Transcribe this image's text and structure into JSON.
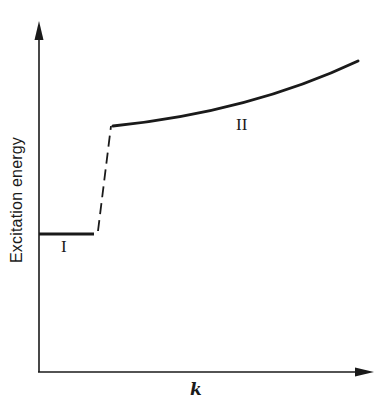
{
  "diagram": {
    "y_axis_label": "Excitation energy",
    "x_axis_label": "k",
    "regions": [
      {
        "label": "I",
        "description": "flat low-energy branch"
      },
      {
        "label": "II",
        "description": "rising high-energy branch"
      }
    ],
    "connector": "dashed jump from branch I to branch II",
    "colors": {
      "line": "#1a1a1a",
      "background": "#ffffff"
    }
  }
}
